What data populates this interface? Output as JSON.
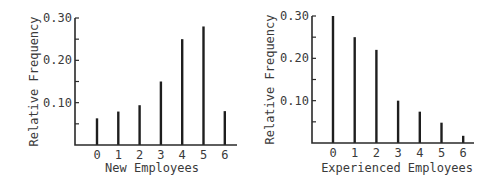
{
  "chart_data": [
    {
      "type": "bar",
      "title": "",
      "xlabel": "New Employees",
      "ylabel": "Relative Frequency",
      "categories": [
        "0",
        "1",
        "2",
        "3",
        "4",
        "5",
        "6"
      ],
      "values": [
        0.063,
        0.079,
        0.094,
        0.15,
        0.25,
        0.28,
        0.08
      ],
      "ylim": [
        0,
        0.3
      ],
      "yticks": [
        "0.10",
        "0.20",
        "0.30"
      ],
      "grid": false,
      "style": "spike"
    },
    {
      "type": "bar",
      "title": "",
      "xlabel": "Experienced Employees",
      "ylabel": "Relative Frequency",
      "categories": [
        "0",
        "1",
        "2",
        "3",
        "4",
        "5",
        "6"
      ],
      "values": [
        0.3,
        0.25,
        0.22,
        0.1,
        0.074,
        0.048,
        0.017
      ],
      "ylim": [
        0,
        0.3
      ],
      "yticks": [
        "0.10",
        "0.20",
        "0.30"
      ],
      "grid": false,
      "style": "spike"
    }
  ],
  "layout": [
    {
      "axis_x": 75,
      "base_y": 145,
      "top_y": 18,
      "x_end": 237,
      "first_bar_x": 97,
      "bar_step": 21.3,
      "ylabel_x": 34,
      "ytick_right": 72,
      "xtick_y": 159,
      "xtitle_x": 152,
      "xtitle_y": 172
    },
    {
      "axis_x": 312,
      "base_y": 143,
      "top_y": 16,
      "x_end": 474,
      "first_bar_x": 333,
      "bar_step": 21.7,
      "ylabel_x": 270,
      "ytick_right": 309,
      "xtick_y": 157,
      "xtitle_x": 397,
      "xtitle_y": 172
    }
  ]
}
